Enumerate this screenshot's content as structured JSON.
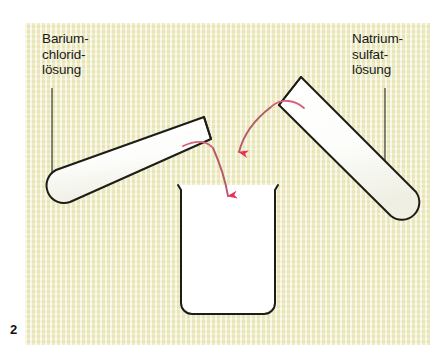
{
  "figure": {
    "number": "2",
    "panel_background_color": "#f1efca",
    "ink_color": "#1a1a1a",
    "arrow_head_color": "#e8305c",
    "arrow_stroke_color": "#b5596b",
    "glass_fill_color": "#ffffff"
  },
  "labels": {
    "left": {
      "name": "barium-chloride-solution",
      "lines": [
        "Barium-",
        "chlorid-",
        "lösung"
      ],
      "text": "Barium-\nchlorid-\nlösung"
    },
    "right": {
      "name": "sodium-sulfate-solution",
      "lines": [
        "Natrium-",
        "sulfat-",
        "lösung"
      ],
      "text": "Natrium-\nsulfat-\nlösung"
    }
  },
  "apparatus": {
    "left_test_tube": "test-tube-tilted-left",
    "right_test_tube": "test-tube-tilted-right",
    "beaker": "beaker",
    "pour_arrow_left": "pour-arrow-from-left-tube",
    "pour_arrow_right": "pour-arrow-from-right-tube",
    "leader_line_left": "leader-line-left",
    "leader_line_right": "leader-line-right"
  }
}
